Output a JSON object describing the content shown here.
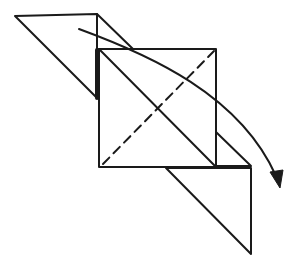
{
  "diagram": {
    "type": "origami-fold-step",
    "colors": {
      "background": "#ffffff",
      "ink": "#1a1a1a"
    },
    "stroke": {
      "normal": 2,
      "thick_edge": 4,
      "dash": "9 6"
    },
    "shapes": {
      "left_triangle": [
        [
          15,
          16
        ],
        [
          97,
          14
        ],
        [
          97,
          98
        ]
      ],
      "top_flap_line": [
        [
          97,
          14
        ],
        [
          133,
          49
        ]
      ],
      "square": [
        [
          99,
          49
        ],
        [
          216,
          49
        ],
        [
          216,
          167
        ],
        [
          99,
          167
        ]
      ],
      "square_diagonal": [
        [
          99,
          49
        ],
        [
          216,
          167
        ]
      ],
      "valley_fold_dashed": [
        [
          103,
          164
        ],
        [
          214,
          51
        ]
      ],
      "thick_edge": [
        [
          97,
          50
        ],
        [
          97,
          98
        ]
      ],
      "right_flap": [
        [
          216,
          132
        ],
        [
          251,
          166
        ],
        [
          216,
          166
        ]
      ],
      "bottom_triangle": [
        [
          166,
          168
        ],
        [
          251,
          168
        ],
        [
          251,
          254
        ]
      ]
    },
    "arrow": {
      "label": "fold-over arrow",
      "path": "M 79 29 C 150 55, 240 95, 278 180",
      "head_tip": [
        280,
        187
      ]
    }
  }
}
